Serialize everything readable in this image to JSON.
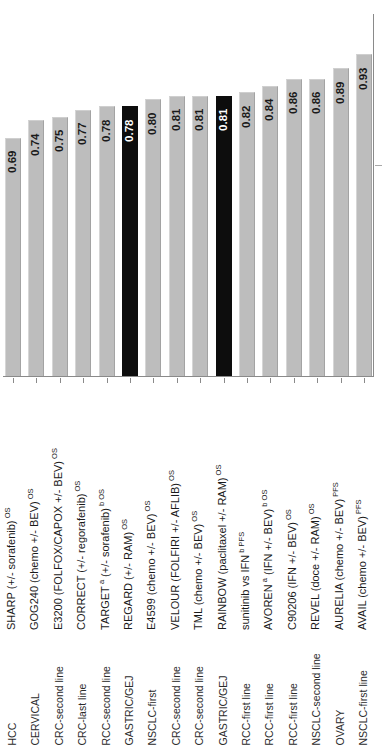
{
  "figure": {
    "name": "hazard-ratio-bar-chart",
    "value_axis_label": "",
    "category_axis_label": ""
  },
  "colors": {
    "bar_light": "#bdbdbd",
    "bar_highlight": "#0d0d0d",
    "axis": "#8a8a8a",
    "text": "#1a1a1a",
    "value_on_dark": "#ffffff",
    "background": "#ffffff"
  },
  "chart_data": {
    "type": "bar",
    "title": "",
    "xlabel": "",
    "ylabel": "",
    "ylim": [
      0.0,
      1.0
    ],
    "grid": false,
    "legend": "none",
    "orientation": "vertical",
    "highlight_color": "#0d0d0d",
    "base_color": "#bdbdbd",
    "categories": [
      "SHARP (+/- sorafenib)",
      "GOG240 (chemo +/- BEV)",
      "E3200 (FOLFOX/CAPOX +/- BEV)",
      "CORRECT (+/- regorafenib)",
      "TARGET a (+/- sorafenib) b",
      "REGARD (+/- RAM)",
      "E4599 (chemo +/- BEV)",
      "VELOUR (FOLFIRI +/- AFLIB)",
      "TML (chemo +/- BEV)",
      "RAINBOW (paclitaxel +/- RAM)",
      "sunitinib vs IFN b",
      "AVOREN a (IFN +/- BEV) b",
      "C90206 (IFN +/- BEV)",
      "REVEL (doce +/- RAM)",
      "AURELIA (chemo +/- BEV)",
      "AVAIL (chemo +/- BEV)"
    ],
    "values": [
      0.69,
      0.74,
      0.75,
      0.77,
      0.78,
      0.78,
      0.8,
      0.81,
      0.81,
      0.81,
      0.82,
      0.84,
      0.86,
      0.86,
      0.89,
      0.93
    ],
    "highlighted": [
      false,
      false,
      false,
      false,
      false,
      true,
      false,
      false,
      false,
      true,
      false,
      false,
      false,
      false,
      false,
      false
    ],
    "data_labels": [
      "0.69",
      "0.74",
      "0.75",
      "0.77",
      "0.78",
      "0.78",
      "0.80",
      "0.81",
      "0.81",
      "0.81",
      "0.82",
      "0.84",
      "0.86",
      "0.86",
      "0.89",
      "0.93"
    ],
    "group_labels": [
      "HCC",
      "CERVICAL",
      "CRC-second line",
      "CRC-last line",
      "RCC-second line",
      "GASTRIC/GEJ",
      "NSCLC-first",
      "CRC-second line",
      "CRC-second line",
      "GASTRIC/GEJ",
      "RCC-first line",
      "RCC-first line",
      "RCC-first line",
      "NSCLC-second line",
      "OVARY",
      "NSCLC-first line"
    ],
    "endpoint_superscripts": [
      "OS",
      "OS",
      "OS",
      "OS",
      "OS",
      "OS",
      "OS",
      "OS",
      "OS",
      "OS",
      "PFS",
      "OS",
      "OS",
      "OS",
      "PFS",
      "PFS"
    ],
    "footnote_superscripts": [
      "",
      "",
      "",
      "",
      "a / b",
      "",
      "",
      "",
      "",
      "",
      "b",
      "a / b",
      "",
      "",
      "",
      ""
    ]
  },
  "trial_labels": [
    {
      "name": "SHARP (+/- sorafenib)",
      "pre_sup": "",
      "post_sup": "OS"
    },
    {
      "name": "GOG240 (chemo +/- BEV)",
      "pre_sup": "",
      "post_sup": "OS"
    },
    {
      "name": "E3200 (FOLFOX/CAPOX +/- BEV)",
      "pre_sup": "",
      "post_sup": "OS"
    },
    {
      "name": "CORRECT (+/- regorafenib)",
      "pre_sup": "",
      "post_sup": "OS"
    },
    {
      "name": "TARGET",
      "mid": "(+/- sorafenib)",
      "pre_sup": "a",
      "post_sup": "b OS"
    },
    {
      "name": "REGARD (+/- RAM)",
      "pre_sup": "",
      "post_sup": "OS"
    },
    {
      "name": "E4599 (chemo +/- BEV)",
      "pre_sup": "",
      "post_sup": "OS"
    },
    {
      "name": "VELOUR (FOLFIRI +/- AFLIB)",
      "pre_sup": "",
      "post_sup": "OS"
    },
    {
      "name": "TML (chemo +/- BEV)",
      "pre_sup": "",
      "post_sup": "OS"
    },
    {
      "name": "RAINBOW (paclitaxel +/- RAM)",
      "pre_sup": "",
      "post_sup": "OS"
    },
    {
      "name": "sunitinib vs IFN",
      "pre_sup": "",
      "post_sup": "b PFS"
    },
    {
      "name": "AVOREN",
      "mid": "(IFN +/- BEV)",
      "pre_sup": "a",
      "post_sup": "b OS"
    },
    {
      "name": "C90206 (IFN +/- BEV)",
      "pre_sup": "",
      "post_sup": "OS"
    },
    {
      "name": "REVEL (doce +/- RAM)",
      "pre_sup": "",
      "post_sup": "OS"
    },
    {
      "name": "AURELIA (chemo +/- BEV)",
      "pre_sup": "",
      "post_sup": "PFS"
    },
    {
      "name": "AVAIL (chemo +/- BEV)",
      "pre_sup": "",
      "post_sup": "PFS"
    }
  ],
  "group_labels": [
    "HCC",
    "CERVICAL",
    "CRC-second line",
    "CRC-last line",
    "RCC-second line",
    "GASTRIC/GEJ",
    "NSCLC-first",
    "CRC-second line",
    "CRC-second line",
    "GASTRIC/GEJ",
    "RCC-first line",
    "RCC-first line",
    "RCC-first line",
    "NSCLC-second line",
    "OVARY",
    "NSCLC-first line"
  ]
}
